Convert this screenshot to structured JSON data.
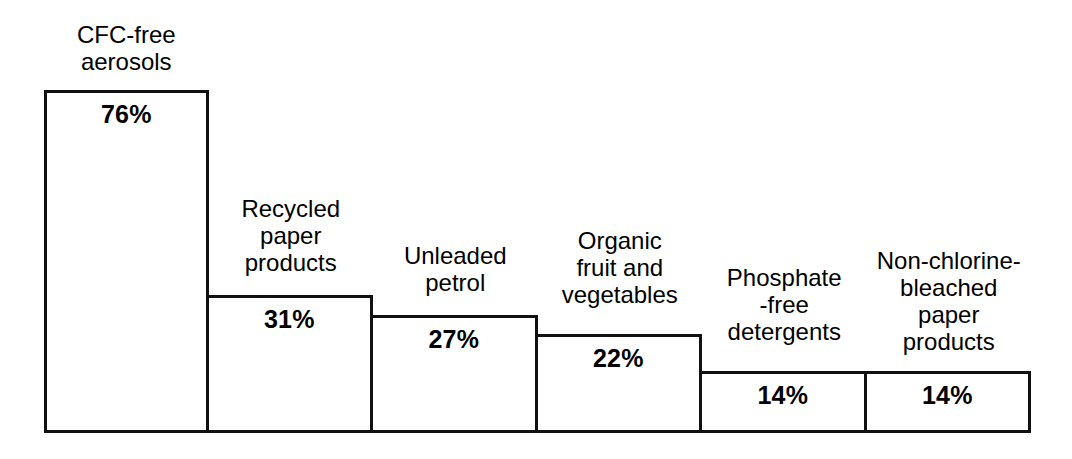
{
  "chart_data": {
    "type": "bar",
    "title": "",
    "subtitle": "",
    "xlabel": "",
    "ylabel": "",
    "grid": false,
    "legend": false,
    "value_suffix": "%",
    "orientation": "vertical",
    "note": "Adjacent bars share vertical edges, forming a descending staircase of outlined rectangles on a common baseline.",
    "categories": [
      "CFC-free\naerosols",
      "Recycled\npaper\nproducts",
      "Unleaded\npetrol",
      "Organic\nfruit and\nvegetables",
      "Phosphate\n-free\ndetergents",
      "Non-chlorine-\nbleached\npaper\nproducts"
    ],
    "values": [
      76,
      31,
      27,
      22,
      14,
      14
    ],
    "value_labels": [
      "76%",
      "31%",
      "27%",
      "22%",
      "14%",
      "14%"
    ],
    "ylim": [
      0,
      100
    ],
    "bars": [
      {
        "category": "CFC-free\naerosols",
        "value": 76,
        "value_label": "76%",
        "bar_top_px": 90,
        "label_top_px": 22
      },
      {
        "category": "Recycled\npaper\nproducts",
        "value": 31,
        "value_label": "31%",
        "bar_top_px": 295,
        "label_top_px": 196
      },
      {
        "category": "Unleaded\npetrol",
        "value": 27,
        "value_label": "27%",
        "bar_top_px": 315,
        "label_top_px": 243
      },
      {
        "category": "Organic\nfruit and\nvegetables",
        "value": 22,
        "value_label": "22%",
        "bar_top_px": 334,
        "label_top_px": 228
      },
      {
        "category": "Phosphate\n-free\ndetergents",
        "value": 14,
        "value_label": "14%",
        "bar_top_px": 371,
        "label_top_px": 265
      },
      {
        "category": "Non-chlorine-\nbleached\npaper\nproducts",
        "value": 14,
        "value_label": "14%",
        "bar_top_px": 371,
        "label_top_px": 248
      }
    ]
  },
  "style": {
    "line_color": "#111111",
    "fill_color": "#ffffff",
    "background": "#ffffff",
    "text_color": "#000000"
  }
}
